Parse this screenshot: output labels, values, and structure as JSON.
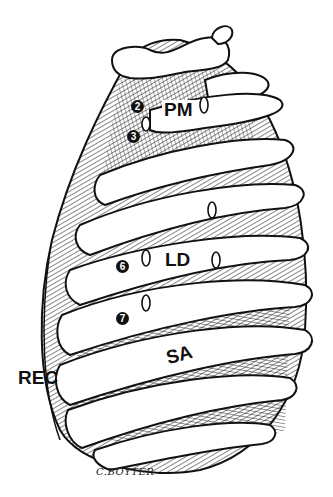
{
  "figure": {
    "labels": {
      "pm": "PM",
      "ld": "LD",
      "sa": "SA",
      "rec": "REC"
    },
    "rib_numbers": {
      "n2": "2",
      "n3": "3",
      "n6": "6",
      "n7": "7"
    },
    "signature": "C.BOYTER"
  }
}
